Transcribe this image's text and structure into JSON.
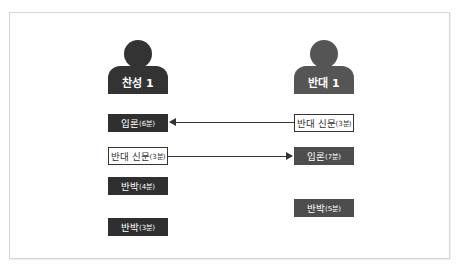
{
  "participants": {
    "pro": {
      "label": "찬성 1",
      "color": "#333333"
    },
    "con": {
      "label": "반대 1",
      "color": "#555555"
    }
  },
  "left_column": [
    {
      "main": "입론",
      "time": "(6분)",
      "style": "dark"
    },
    {
      "main": "반대 신문",
      "time": "(3분)",
      "style": "outline"
    },
    {
      "main": "반박",
      "time": "(4분)",
      "style": "dark"
    },
    {
      "main": "반박",
      "time": "(3분)",
      "style": "dark"
    }
  ],
  "right_column": [
    {
      "main": "반대 신문",
      "time": "(3분)",
      "style": "outline"
    },
    {
      "main": "입론",
      "time": "(7분)",
      "style": "grey"
    },
    {
      "main": "반박",
      "time": "(5분)",
      "style": "grey"
    }
  ],
  "arrows": [
    {
      "from": "right_column.0",
      "to": "left_column.0",
      "direction": "left"
    },
    {
      "from": "left_column.1",
      "to": "right_column.1",
      "direction": "right"
    }
  ]
}
